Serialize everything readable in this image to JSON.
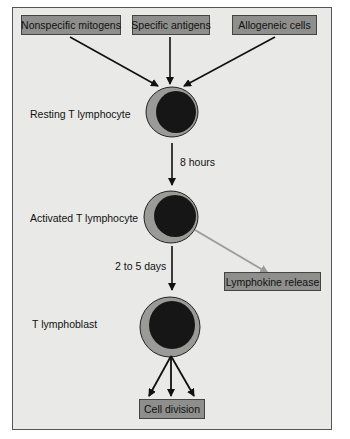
{
  "inputs": [
    {
      "label": "Nonspecific mitogens"
    },
    {
      "label": "Specific antigens"
    },
    {
      "label": "Allogeneic cells"
    }
  ],
  "stages": [
    {
      "label": "Resting T lymphocyte"
    },
    {
      "label": "Activated T lymphocyte"
    },
    {
      "label": "T lymphoblast"
    }
  ],
  "transitions": [
    {
      "label": "8 hours"
    },
    {
      "label": "2 to 5 days"
    }
  ],
  "outputs": {
    "lymphokine": "Lymphokine release",
    "division": "Cell division"
  },
  "colors": {
    "background": "#e9e9e7",
    "box_fill": "#8e8e8c",
    "cell_cytoplasm": "#9a9a98",
    "cell_nucleus": "#161616",
    "gray_arrow": "#9c9c9c"
  }
}
